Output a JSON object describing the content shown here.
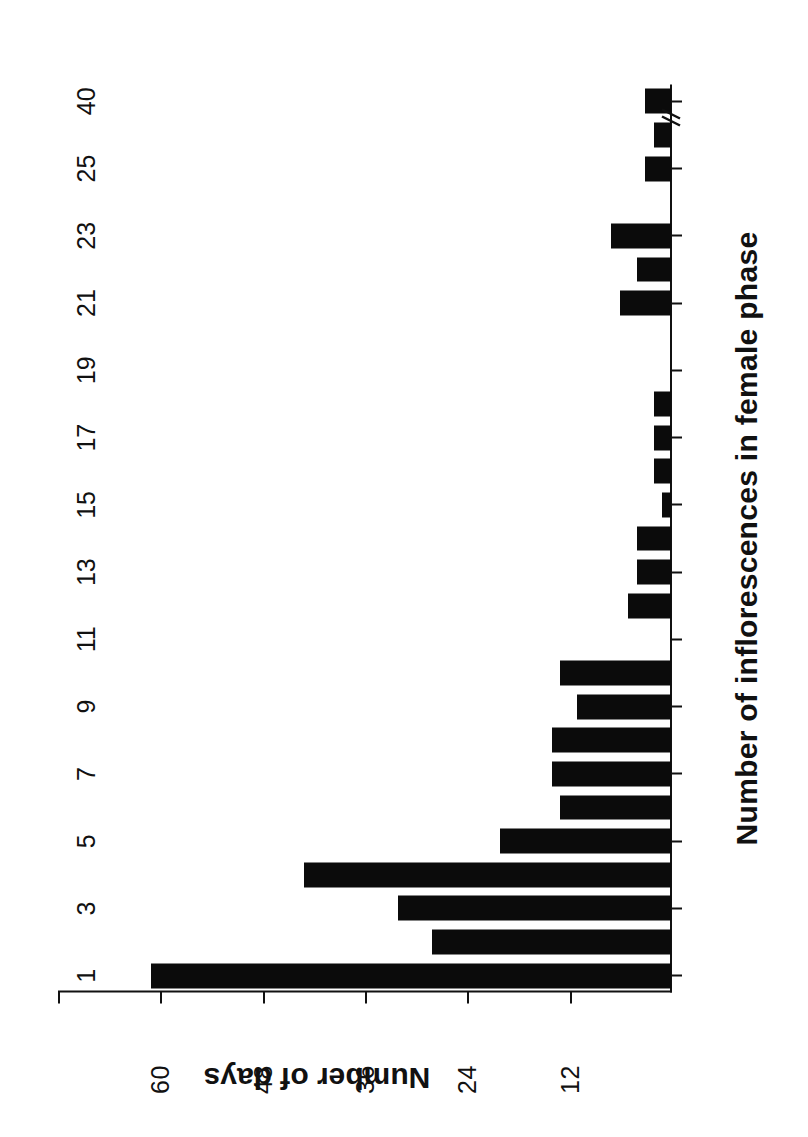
{
  "chart_data": {
    "type": "bar",
    "orientation": "vertical",
    "title": "",
    "xlabel": "Number of inflorescences in female phase",
    "ylabel": "Number of days",
    "categories": [
      "1",
      "2",
      "3",
      "4",
      "5",
      "6",
      "7",
      "8",
      "9",
      "10",
      "11",
      "12",
      "13",
      "14",
      "15",
      "16",
      "17",
      "18",
      "19",
      "20",
      "21",
      "22",
      "23",
      "24",
      "25",
      "26",
      "40"
    ],
    "values": [
      61,
      28,
      32,
      43,
      20,
      13,
      14,
      14,
      11,
      13,
      0,
      5,
      4,
      4,
      1,
      2,
      2,
      2,
      0,
      0,
      6,
      4,
      7,
      0,
      3,
      2,
      3
    ],
    "xtick_labels": [
      "1",
      "3",
      "5",
      "7",
      "9",
      "11",
      "13",
      "15",
      "17",
      "19",
      "21",
      "23",
      "25",
      "40"
    ],
    "ytick_labels": [
      "0",
      "12",
      "24",
      "36",
      "48",
      "60"
    ],
    "ytick_values": [
      0,
      12,
      24,
      36,
      48,
      60
    ],
    "ylim": [
      0,
      72
    ],
    "grid": false,
    "legend": null,
    "axis_break": {
      "present": true,
      "between": [
        "26",
        "40"
      ],
      "symbol": "//"
    },
    "bar_color": "#0b0b0b",
    "axis_color": "#111111",
    "background_color": "#ffffff"
  },
  "figure": {
    "x_axis_title": "Number of inflorescences in female phase",
    "y_axis_title": "Number of days"
  }
}
